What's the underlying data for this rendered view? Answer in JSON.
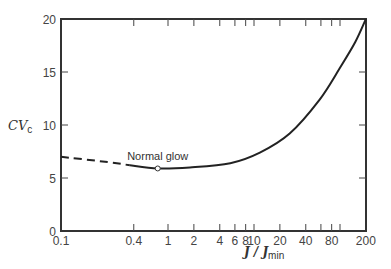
{
  "chart_data": {
    "type": "line",
    "title": "",
    "xlabel": "J / J_min",
    "xlabel_main": "J / J",
    "xlabel_sub": "min",
    "ylabel": "CV_c",
    "ylabel_main": "CV",
    "ylabel_sub": "c",
    "xscale": "log",
    "xlim": [
      0.1,
      200
    ],
    "ylim": [
      0,
      20
    ],
    "grid": false,
    "x_ticks": [
      {
        "value": 0.1,
        "label": "0.1"
      },
      {
        "value": 0.4,
        "label": "0.4"
      },
      {
        "value": 1,
        "label": "1"
      },
      {
        "value": 2,
        "label": "2"
      },
      {
        "value": 4,
        "label": "4"
      },
      {
        "value": 6,
        "label": "6"
      },
      {
        "value": 8,
        "label": "8"
      },
      {
        "value": 10,
        "label": "10"
      },
      {
        "value": 20,
        "label": "20"
      },
      {
        "value": 40,
        "label": "40"
      },
      {
        "value": 60,
        "label": ""
      },
      {
        "value": 80,
        "label": "80"
      },
      {
        "value": 100,
        "label": ""
      },
      {
        "value": 200,
        "label": "200"
      }
    ],
    "y_ticks": [
      0,
      5,
      10,
      15,
      20
    ],
    "series": [
      {
        "name": "extrapolated (dashed)",
        "style": "dashed",
        "x": [
          0.1,
          0.2,
          0.36
        ],
        "y": [
          7.0,
          6.5,
          6.2
        ]
      },
      {
        "name": "measured (solid)",
        "style": "solid",
        "x": [
          0.36,
          0.76,
          1.8,
          5.3,
          11.7,
          26,
          58,
          100,
          150,
          200
        ],
        "y": [
          6.2,
          5.9,
          6.0,
          6.4,
          7.4,
          9.2,
          12.4,
          15.4,
          17.8,
          20.0
        ]
      }
    ],
    "annotations": [
      {
        "text": "Normal glow",
        "x": 0.76,
        "y": 5.9,
        "marker": "open-circle"
      }
    ]
  }
}
